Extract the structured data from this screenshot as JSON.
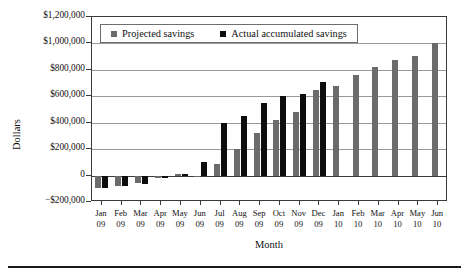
{
  "chart_data": {
    "type": "bar",
    "title": "",
    "xlabel": "Month",
    "ylabel": "Dollars",
    "ylim": [
      -200000,
      1200000
    ],
    "ytick_values": [
      1200000,
      1000000,
      800000,
      600000,
      400000,
      200000,
      0,
      -200000
    ],
    "ytick_labels": [
      "$1,200,000",
      "$1,000,000",
      "$800,000",
      "$600,000",
      "$400,000",
      "$200,000",
      "0",
      "−$200,000"
    ],
    "grid": "horizontal",
    "legend_position": "top-inside",
    "categories": [
      "Jan 09",
      "Feb 09",
      "Mar 09",
      "Apr 09",
      "May 09",
      "Jun 09",
      "Jul 09",
      "Aug 09",
      "Sep 09",
      "Oct 09",
      "Nov 09",
      "Dec 09",
      "Jan 10",
      "Feb 10",
      "Mar 10",
      "Apr 10",
      "May 10",
      "Jun 10"
    ],
    "category_months": [
      "Jan",
      "Feb",
      "Mar",
      "Apr",
      "May",
      "Jun",
      "Jul",
      "Aug",
      "Sep",
      "Oct",
      "Nov",
      "Dec",
      "Jan",
      "Feb",
      "Mar",
      "Apr",
      "May",
      "Jun"
    ],
    "category_years": [
      "09",
      "09",
      "09",
      "09",
      "09",
      "09",
      "09",
      "09",
      "09",
      "09",
      "09",
      "09",
      "10",
      "10",
      "10",
      "10",
      "10",
      "10"
    ],
    "series": [
      {
        "name": "Projected savings",
        "color": "#6b6b6b",
        "values": [
          -95000,
          -80000,
          -60000,
          -15000,
          15000,
          0,
          90000,
          200000,
          325000,
          420000,
          480000,
          645000,
          675000,
          760000,
          820000,
          875000,
          905000,
          1000000
        ]
      },
      {
        "name": "Actual accumulated savings",
        "color": "#0d0d0d",
        "values": [
          -95000,
          -80000,
          -65000,
          -20000,
          15000,
          105000,
          400000,
          450000,
          550000,
          600000,
          615000,
          710000,
          null,
          null,
          null,
          null,
          null,
          null
        ]
      }
    ]
  },
  "legend": {
    "items": [
      {
        "label": "Projected savings",
        "icon": "square-swatch-gray"
      },
      {
        "label": "Actual accumulated savings",
        "icon": "square-swatch-black"
      }
    ]
  },
  "axes": {
    "y_title": "Dollars",
    "x_title": "Month"
  }
}
